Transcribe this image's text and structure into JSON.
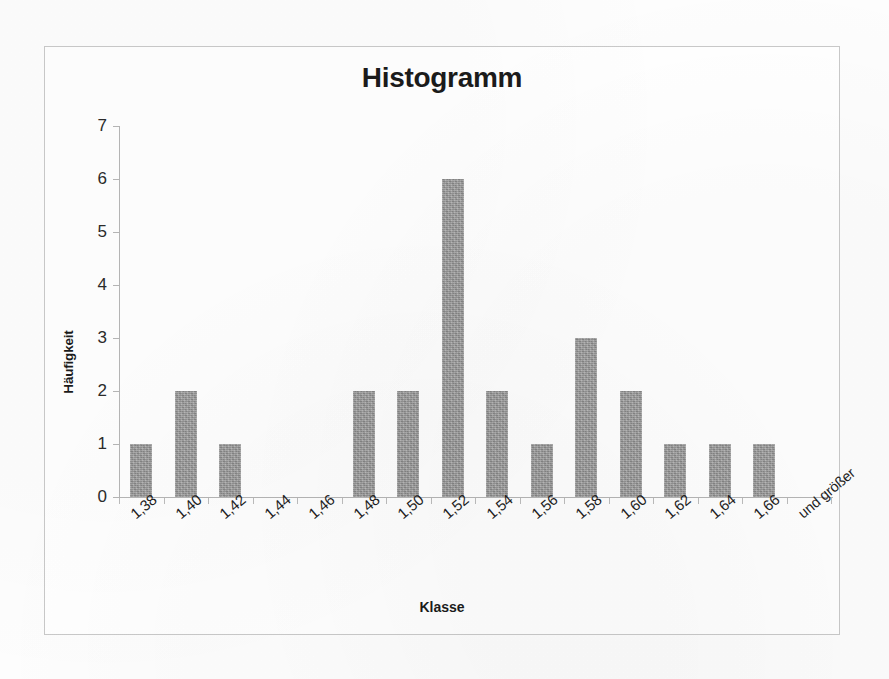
{
  "chart_data": {
    "type": "bar",
    "title": "Histogramm",
    "xlabel": "Klasse",
    "ylabel": "Häufigkeit",
    "categories": [
      "1,38",
      "1,40",
      "1,42",
      "1,44",
      "1,46",
      "1,48",
      "1,50",
      "1,52",
      "1,54",
      "1,56",
      "1,58",
      "1,60",
      "1,62",
      "1,64",
      "1,66",
      "und größer"
    ],
    "values": [
      1,
      2,
      1,
      0,
      0,
      2,
      2,
      6,
      2,
      1,
      3,
      2,
      1,
      1,
      1,
      0
    ],
    "ylim": [
      0,
      7
    ],
    "yticks": [
      "0",
      "1",
      "2",
      "3",
      "4",
      "5",
      "6",
      "7"
    ],
    "grid": false,
    "legend": false,
    "bar_color": "#9b9b9b",
    "axis_color": "#b6b6b6",
    "text_color": "#1b1b1b"
  }
}
